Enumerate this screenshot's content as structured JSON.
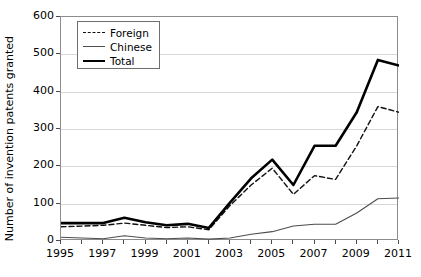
{
  "chart_data": {
    "type": "line",
    "title": "",
    "xlabel": "",
    "ylabel": "Number of invention patents granted",
    "xlim": [
      1995,
      2011
    ],
    "ylim": [
      0,
      600
    ],
    "ytick_step": 100,
    "xtick_step": 2,
    "grid": true,
    "legend_position": "top-left",
    "x": [
      1995,
      1996,
      1997,
      1998,
      1999,
      2000,
      2001,
      2002,
      2003,
      2004,
      2005,
      2006,
      2007,
      2008,
      2009,
      2010,
      2011
    ],
    "series": [
      {
        "name": "Foreign",
        "style": "dashed",
        "color": "#111111",
        "values": [
          38,
          40,
          42,
          48,
          42,
          36,
          38,
          30,
          95,
          150,
          195,
          125,
          175,
          165,
          255,
          360,
          345
        ]
      },
      {
        "name": "Chinese",
        "style": "thin-solid",
        "color": "#4d4d4d",
        "values": [
          10,
          8,
          6,
          14,
          8,
          6,
          8,
          5,
          8,
          18,
          25,
          40,
          45,
          45,
          75,
          113,
          115
        ]
      },
      {
        "name": "Total",
        "style": "thick-solid",
        "color": "#000000",
        "values": [
          48,
          48,
          48,
          62,
          50,
          42,
          46,
          35,
          103,
          168,
          218,
          150,
          255,
          255,
          345,
          485,
          470
        ]
      }
    ],
    "ytick_labels": [
      "0",
      "100",
      "200",
      "300",
      "400",
      "500",
      "600"
    ],
    "xtick_labels": [
      "1995",
      "1997",
      "1999",
      "2001",
      "2003",
      "2005",
      "2007",
      "2009",
      "2011"
    ]
  },
  "legend": {
    "items": [
      {
        "label": "Foreign"
      },
      {
        "label": "Chinese"
      },
      {
        "label": "Total"
      }
    ]
  }
}
